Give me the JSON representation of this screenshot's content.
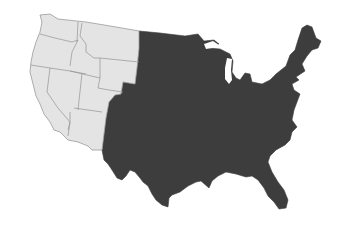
{
  "map": {
    "subject": "Contiguous United States",
    "colors": {
      "background": "#ffffff",
      "west_fill": "#e4e4e4",
      "east_fill": "#3d3d3d",
      "border": "#9a9a9a"
    },
    "regions": [
      {
        "name": "West (light)",
        "fill": "#e4e4e4",
        "states": [
          "Washington",
          "Oregon",
          "California",
          "Idaho",
          "Nevada",
          "Montana",
          "Wyoming",
          "Utah",
          "Arizona"
        ]
      },
      {
        "name": "Rest of US (dark)",
        "fill": "#3d3d3d",
        "states": [
          "Other contiguous states east of the Mountain West"
        ]
      }
    ]
  }
}
